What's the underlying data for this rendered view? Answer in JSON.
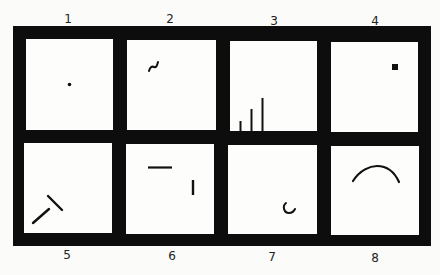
{
  "figure": {
    "panels": [
      {
        "number": "1",
        "content": "small dot"
      },
      {
        "number": "2",
        "content": "small tilde squiggle"
      },
      {
        "number": "3",
        "content": "three vertical lines of increasing height"
      },
      {
        "number": "4",
        "content": "small filled square"
      },
      {
        "number": "5",
        "content": "two line segments forming a T-like angle"
      },
      {
        "number": "6",
        "content": "horizontal line and short vertical line"
      },
      {
        "number": "7",
        "content": "small C-shaped arc"
      },
      {
        "number": "8",
        "content": "large upward arc"
      }
    ],
    "colors": {
      "frame": "#0d0d0d",
      "panel": "#fdfdfc",
      "stroke": "#111111"
    }
  }
}
